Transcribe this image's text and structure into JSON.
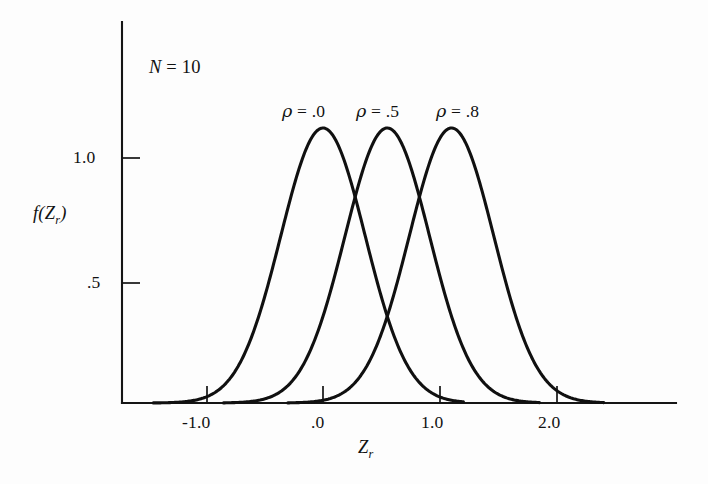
{
  "figure": {
    "background_color": "#fdfdfd",
    "ink_color": "#111111"
  },
  "annotations": {
    "sample_size_symbol": "N",
    "sample_size_equals": " = ",
    "sample_size_value": "10",
    "sample_size_text": "N = 10"
  },
  "axes": {
    "y_title_main": "f(Z",
    "y_title_sub": "r",
    "y_title_close": ")",
    "y_title_text": "f(Zr)",
    "x_title_main": "Z",
    "x_title_sub": "r",
    "x_title_text": "Zr",
    "x_ticks": [
      "-1.0",
      ".0",
      "1.0",
      "2.0"
    ],
    "y_ticks": [
      "1.0",
      ".5"
    ]
  },
  "curve_labels": [
    {
      "symbol": "ρ",
      "equals": " = ",
      "value": ".0"
    },
    {
      "symbol": "ρ",
      "equals": " = ",
      "value": ".5"
    },
    {
      "symbol": "ρ",
      "equals": " = ",
      "value": ".8"
    }
  ],
  "chart_data": {
    "type": "line",
    "title": "",
    "subtitle": "",
    "xlabel": "Zr",
    "ylabel": "f(Zr)",
    "xlim": [
      -1.5,
      2.7
    ],
    "ylim": [
      0,
      1.6
    ],
    "grid": false,
    "legend_position": "above-curves (inline annotations)",
    "annotation": "N = 10",
    "x_tick_values": [
      -1.0,
      0.0,
      1.0,
      2.0
    ],
    "x_tick_labels": [
      "-1.0",
      ".0",
      "1.0",
      "2.0"
    ],
    "y_tick_values": [
      0.5,
      1.0
    ],
    "y_tick_labels": [
      ".5",
      "1.0"
    ],
    "series": [
      {
        "name": "ρ = .0",
        "mean": 0.0,
        "sd": 0.3615,
        "peak_x": 0.0,
        "peak_y": 1.1,
        "x_start": -1.45,
        "x_end": 1.2,
        "x": [
          -1.45,
          -1.3,
          -1.1,
          -0.9,
          -0.7,
          -0.5,
          -0.3,
          -0.15,
          0.0,
          0.15,
          0.3,
          0.5,
          0.7,
          0.9,
          1.1,
          1.2
        ],
        "y": [
          0.0,
          0.01,
          0.05,
          0.15,
          0.36,
          0.65,
          0.93,
          1.06,
          1.1,
          1.06,
          0.93,
          0.65,
          0.36,
          0.15,
          0.05,
          0.03
        ]
      },
      {
        "name": "ρ = .5",
        "mean": 0.5493,
        "sd": 0.3615,
        "peak_x": 0.5493,
        "peak_y": 1.1,
        "x_start": -0.85,
        "x_end": 1.85,
        "x": [
          -0.85,
          -0.7,
          -0.5,
          -0.3,
          -0.15,
          0.05,
          0.25,
          0.4,
          0.55,
          0.7,
          0.85,
          1.05,
          1.25,
          1.45,
          1.65,
          1.85
        ],
        "y": [
          0.0,
          0.02,
          0.06,
          0.18,
          0.32,
          0.6,
          0.9,
          1.04,
          1.1,
          1.04,
          0.9,
          0.6,
          0.32,
          0.13,
          0.04,
          0.01
        ]
      },
      {
        "name": "ρ = .8",
        "mean": 1.0986,
        "sd": 0.3615,
        "peak_x": 1.0986,
        "peak_y": 1.1,
        "x_start": -0.3,
        "x_end": 2.4,
        "x": [
          -0.3,
          -0.15,
          0.05,
          0.25,
          0.45,
          0.6,
          0.8,
          0.95,
          1.1,
          1.25,
          1.4,
          1.6,
          1.8,
          2.0,
          2.2,
          2.4
        ],
        "y": [
          0.0,
          0.02,
          0.06,
          0.18,
          0.44,
          0.66,
          0.95,
          1.06,
          1.1,
          1.06,
          0.95,
          0.66,
          0.36,
          0.15,
          0.05,
          0.0
        ]
      }
    ]
  }
}
